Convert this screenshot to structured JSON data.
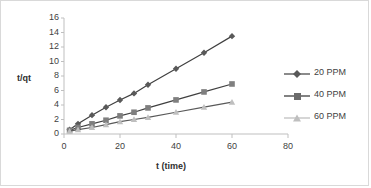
{
  "chart_data": {
    "type": "line",
    "title": "",
    "subtitle": "",
    "xlabel": "t (time)",
    "ylabel": "t/qt",
    "xlim": [
      0,
      80
    ],
    "ylim": [
      0,
      16
    ],
    "xticks": [
      0,
      20,
      40,
      60,
      80
    ],
    "yticks": [
      0,
      2,
      4,
      6,
      8,
      10,
      12,
      14,
      16
    ],
    "grid": false,
    "legend_position": "right",
    "x": [
      2,
      5,
      10,
      15,
      20,
      25,
      30,
      40,
      50,
      60
    ],
    "series": [
      {
        "name": "20 PPM",
        "marker": "diamond",
        "color": "#595959",
        "line_color": "#404040",
        "values": [
          0.6,
          1.4,
          2.6,
          3.7,
          4.7,
          5.6,
          6.8,
          9.0,
          11.2,
          13.5
        ]
      },
      {
        "name": "40 PPM",
        "marker": "square",
        "color": "#7f7f7f",
        "line_color": "#404040",
        "values": [
          0.5,
          0.9,
          1.4,
          1.9,
          2.5,
          3.0,
          3.6,
          4.7,
          5.8,
          6.9
        ]
      },
      {
        "name": "60 PPM",
        "marker": "triangle",
        "color": "#bfbfbf",
        "line_color": "#595959",
        "values": [
          0.4,
          0.6,
          0.9,
          1.3,
          1.7,
          2.0,
          2.3,
          3.0,
          3.7,
          4.4
        ]
      }
    ]
  },
  "axes": {
    "y_title": "t/qt",
    "x_title": "t (time)",
    "y_tick_labels": [
      "0",
      "2",
      "4",
      "6",
      "8",
      "10",
      "12",
      "14",
      "16"
    ],
    "x_tick_labels": [
      "0",
      "20",
      "40",
      "60",
      "80"
    ]
  },
  "legend": {
    "entries": [
      {
        "label": "20 PPM"
      },
      {
        "label": "40 PPM"
      },
      {
        "label": "60 PPM"
      }
    ]
  }
}
